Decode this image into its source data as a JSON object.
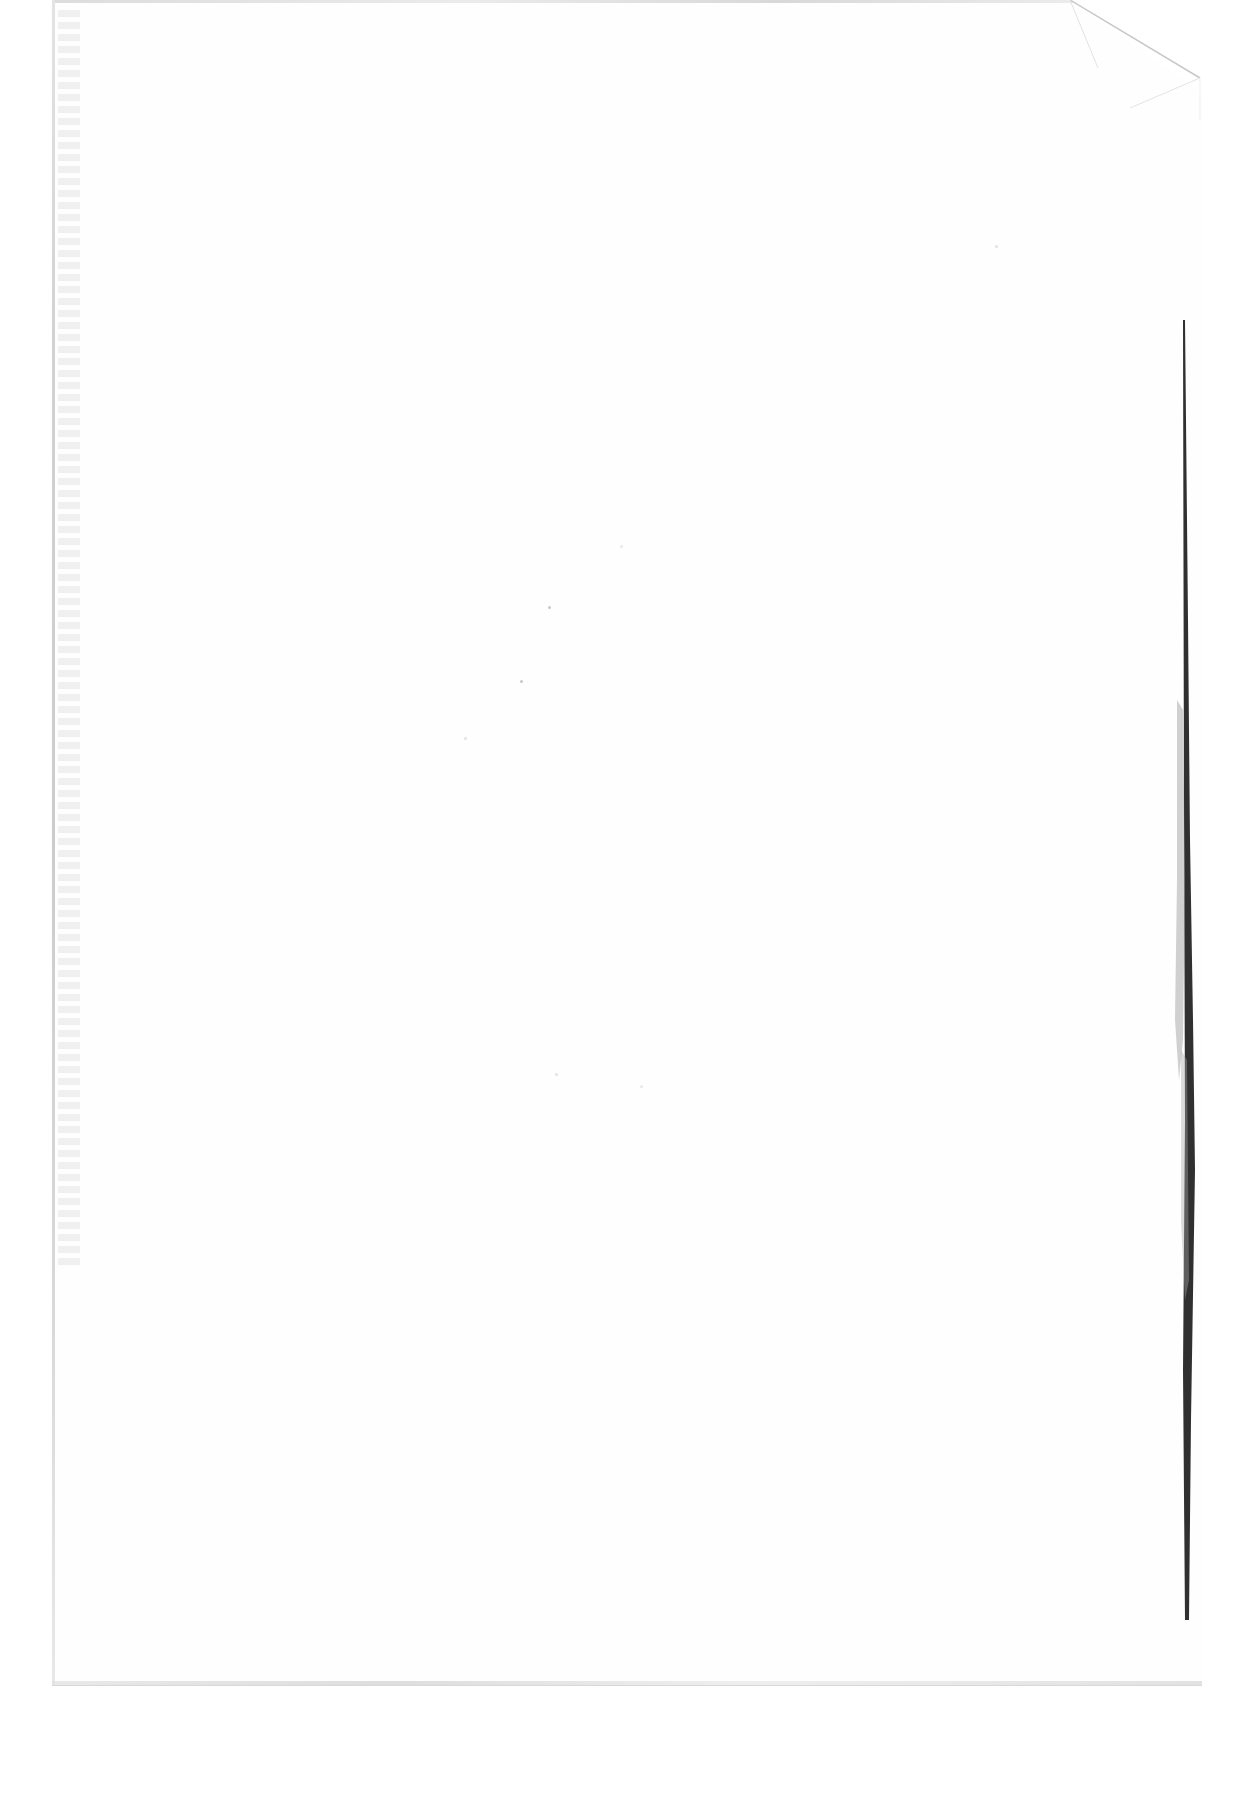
{
  "document": {
    "type": "scanned-page",
    "content_state": "blank",
    "page_background": "#fefefe",
    "canvas_background": "#ffffff",
    "edge_color": "#d2d2d2",
    "binding_shadow_color": "#111111",
    "features": {
      "folded_corner": "top-right",
      "binding_shadow": "right-edge",
      "bleed_through": "left-edge, illegible"
    }
  }
}
